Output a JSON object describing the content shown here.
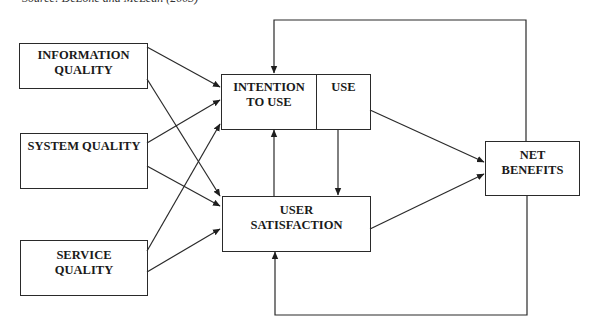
{
  "caption": "Source: DeLone and McLean (2003)",
  "boxes": {
    "information_quality": {
      "line1": "INFORMATION",
      "line2": "QUALITY"
    },
    "system_quality": {
      "line1": "SYSTEM QUALITY"
    },
    "service_quality": {
      "line1": "SERVICE",
      "line2": "QUALITY"
    },
    "intention_to_use": {
      "line1": "INTENTION",
      "line2": "TO USE"
    },
    "use": {
      "line1": "USE"
    },
    "user_satisfaction": {
      "line1": "USER",
      "line2": "SATISFACTION"
    },
    "net_benefits": {
      "line1": "NET",
      "line2": "BENEFITS"
    }
  },
  "edges": [
    {
      "from": "Information Quality",
      "to": "Intention to Use"
    },
    {
      "from": "Information Quality",
      "to": "User Satisfaction"
    },
    {
      "from": "System Quality",
      "to": "Intention to Use"
    },
    {
      "from": "System Quality",
      "to": "User Satisfaction"
    },
    {
      "from": "Service Quality",
      "to": "Intention to Use"
    },
    {
      "from": "Service Quality",
      "to": "User Satisfaction"
    },
    {
      "from": "User Satisfaction",
      "to": "Intention to Use"
    },
    {
      "from": "Use",
      "to": "User Satisfaction"
    },
    {
      "from": "Use",
      "to": "Net Benefits"
    },
    {
      "from": "User Satisfaction",
      "to": "Net Benefits"
    },
    {
      "from": "Net Benefits",
      "to": "Intention to Use",
      "type": "feedback"
    },
    {
      "from": "Net Benefits",
      "to": "User Satisfaction",
      "type": "feedback"
    }
  ],
  "colors": {
    "line": "#2a2a2a",
    "background": "#ffffff"
  }
}
